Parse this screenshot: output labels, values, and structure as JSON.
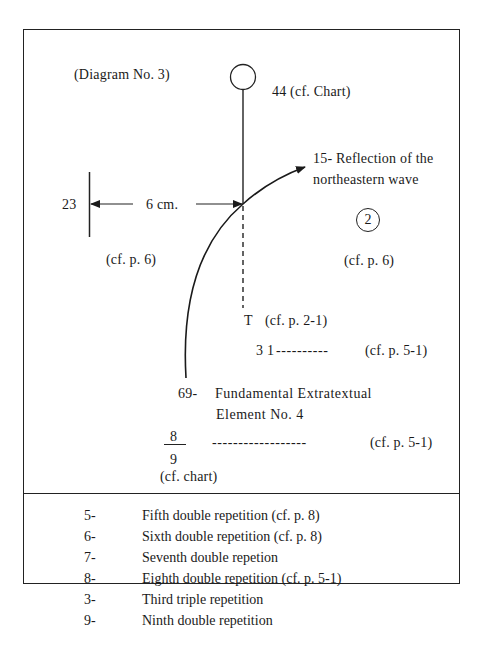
{
  "diagram": {
    "title": "(Diagram No. 3)",
    "node_44": "44 (cf. Chart)",
    "node_23": "23",
    "distance_label": "6 cm.",
    "node_15_line1": "15- Reflection of the",
    "node_15_line2": "northeastern wave",
    "circled_number": "2",
    "ref_left": "(cf. p. 6)",
    "ref_right": "(cf. p. 6)",
    "node_T": "T",
    "node_T_ref": "(cf. p. 2-1)",
    "node_31": "3 1",
    "node_31_dashes": "----------",
    "node_31_ref": "(cf. p. 5-1)",
    "node_69_num": "69-",
    "node_69_line1": "Fundamental Extratextual",
    "node_69_line2": "Element No. 4",
    "fraction_numerator": "8",
    "fraction_denominator": "9",
    "fraction_dashes": "------------------",
    "fraction_ref": "(cf. p. 5-1)",
    "fraction_caption": "(cf. chart)"
  },
  "legend": {
    "items": [
      {
        "num": "5-",
        "text": "Fifth double repetition (cf. p. 8)"
      },
      {
        "num": "6-",
        "text": "Sixth double repetition (cf. p. 8)"
      },
      {
        "num": "7-",
        "text": "Seventh double repetion"
      },
      {
        "num": "8-",
        "text": "Eighth double repetition (cf. p. 5-1)"
      },
      {
        "num": "3-",
        "text": "Third triple repetition"
      },
      {
        "num": "9-",
        "text": "Ninth double repetition"
      }
    ]
  }
}
